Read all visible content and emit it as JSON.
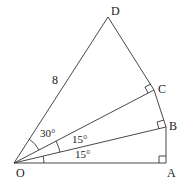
{
  "diagram": {
    "points": {
      "O": {
        "label": "O",
        "x": 14,
        "y": 163
      },
      "A": {
        "label": "A",
        "x": 166,
        "y": 163
      },
      "B": {
        "label": "B",
        "x": 166,
        "y": 127
      },
      "C": {
        "label": "C",
        "x": 154,
        "y": 90
      },
      "D": {
        "label": "D",
        "x": 108,
        "y": 17
      }
    },
    "labels": {
      "O": "O",
      "A": "A",
      "B": "B",
      "C": "C",
      "D": "D",
      "side_OD": "8",
      "angle_AOB": "15°",
      "angle_BOC": "15°",
      "angle_COD": "30°"
    },
    "stroke_color": "#333333"
  }
}
